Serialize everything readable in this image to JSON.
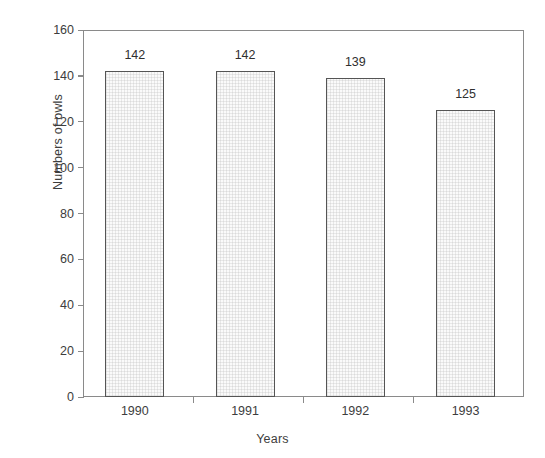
{
  "chart_data": {
    "type": "bar",
    "title": "",
    "subtitle": "",
    "xlabel": "Years",
    "ylabel": "Numbers of owls",
    "categories": [
      "1990",
      "1991",
      "1992",
      "1993"
    ],
    "values": [
      142,
      142,
      139,
      125
    ],
    "value_labels": [
      "142",
      "142",
      "139",
      "125"
    ],
    "ylim": [
      0,
      160
    ],
    "xlim_note": "categorical, 4 bars centered within frame",
    "yticks": [
      0,
      20,
      40,
      60,
      80,
      100,
      120,
      140,
      160
    ],
    "ytick_labels": [
      "0",
      "20",
      "40",
      "60",
      "80",
      "100",
      "120",
      "140",
      "160"
    ],
    "grid": false,
    "legend": null,
    "legend_position": "none",
    "annotations": [
      {
        "text": "142",
        "above_bar": "1990"
      },
      {
        "text": "142",
        "above_bar": "1991"
      },
      {
        "text": "139",
        "above_bar": "1992"
      },
      {
        "text": "125",
        "above_bar": "1993"
      }
    ],
    "colors": {
      "bar_fill": "#fafafa",
      "bar_border": "#555555",
      "axis": "#8a8a8a",
      "text": "#3d3d3d",
      "background": "#ffffff"
    }
  },
  "axes": {
    "y": {
      "label": "Numbers of owls",
      "ticks": [
        {
          "value": 160,
          "label": "160"
        },
        {
          "value": 140,
          "label": "140"
        },
        {
          "value": 120,
          "label": "120"
        },
        {
          "value": 100,
          "label": "100"
        },
        {
          "value": 80,
          "label": "80"
        },
        {
          "value": 60,
          "label": "60"
        },
        {
          "value": 40,
          "label": "40"
        },
        {
          "value": 20,
          "label": "20"
        },
        {
          "value": 0,
          "label": "0"
        }
      ]
    },
    "x": {
      "label": "Years",
      "ticks": [
        {
          "label": "1990"
        },
        {
          "label": "1991"
        },
        {
          "label": "1992"
        },
        {
          "label": "1993"
        }
      ]
    }
  },
  "bars": [
    {
      "category": "1990",
      "value": 142,
      "label": "142"
    },
    {
      "category": "1991",
      "value": 142,
      "label": "142"
    },
    {
      "category": "1992",
      "value": 139,
      "label": "139"
    },
    {
      "category": "1993",
      "value": 125,
      "label": "125"
    }
  ]
}
